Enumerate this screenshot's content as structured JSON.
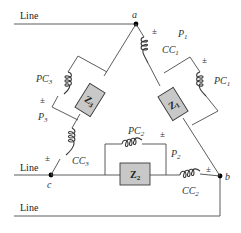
{
  "lines": {
    "line_a": "Line",
    "line_c": "Line",
    "line_b": "Line"
  },
  "nodes": {
    "a": "a",
    "b": "b",
    "c": "c"
  },
  "impedances": {
    "z1": {
      "main": "Z",
      "sub": "1"
    },
    "z2": {
      "main": "Z",
      "sub": "2"
    },
    "z3": {
      "main": "Z",
      "sub": "3"
    }
  },
  "current_coils": {
    "cc1": {
      "main": "CC",
      "sub": "1"
    },
    "cc2": {
      "main": "CC",
      "sub": "2"
    },
    "cc3": {
      "main": "CC",
      "sub": "3"
    }
  },
  "potential_coils": {
    "pc1": {
      "main": "PC",
      "sub": "1"
    },
    "pc2": {
      "main": "PC",
      "sub": "2"
    },
    "pc3": {
      "main": "PC",
      "sub": "3"
    }
  },
  "wattmeters": {
    "p1": {
      "main": "P",
      "sub": "1"
    },
    "p2": {
      "main": "P",
      "sub": "2"
    },
    "p3": {
      "main": "P",
      "sub": "3"
    }
  },
  "polarity_mark": "±",
  "colors": {
    "wire": "#4a4a4a",
    "impedance_fill": "#c8c8c8",
    "background": "#ffffff"
  }
}
